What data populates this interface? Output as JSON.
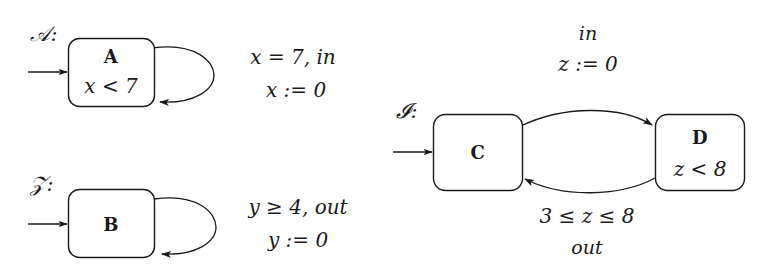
{
  "diagram": {
    "title_visible": false,
    "background_color": "#ffffff",
    "stroke_color": "#1a1a1a",
    "automata": [
      {
        "name": "ℋ:",
        "name_display": "𝒜:",
        "id": "automaton-a",
        "states": [
          {
            "id": "state-a",
            "name": "A",
            "invariant": "x < 7",
            "initial": true
          }
        ],
        "transitions": [
          {
            "id": "transition-a-self",
            "from": "A",
            "to": "A",
            "kind": "self-loop",
            "guard": "x = 7, in",
            "update": "x := 0"
          }
        ]
      },
      {
        "name": "B:",
        "name_display": "𝒵:",
        "id": "automaton-b",
        "states": [
          {
            "id": "state-b",
            "name": "B",
            "invariant": "",
            "initial": true
          }
        ],
        "transitions": [
          {
            "id": "transition-b-self",
            "from": "B",
            "to": "B",
            "kind": "self-loop",
            "guard": "y ≥ 4, out",
            "update": "y := 0"
          }
        ]
      },
      {
        "name": "I:",
        "name_display": "𝓘:",
        "id": "automaton-i",
        "states": [
          {
            "id": "state-c",
            "name": "C",
            "invariant": "",
            "initial": true
          },
          {
            "id": "state-d",
            "name": "D",
            "invariant": "z < 8",
            "initial": false
          }
        ],
        "transitions": [
          {
            "id": "transition-c-to-d",
            "from": "C",
            "to": "D",
            "kind": "curve-top",
            "guard": "in",
            "update": "z := 0"
          },
          {
            "id": "transition-d-to-c",
            "from": "D",
            "to": "C",
            "kind": "curve-bottom",
            "guard": "3 ≤ z ≤ 8",
            "update": "out"
          }
        ]
      }
    ],
    "icons": {
      "initial_arrow": "arrow-right-icon",
      "transition_arrowhead": "arrowhead-icon"
    }
  }
}
